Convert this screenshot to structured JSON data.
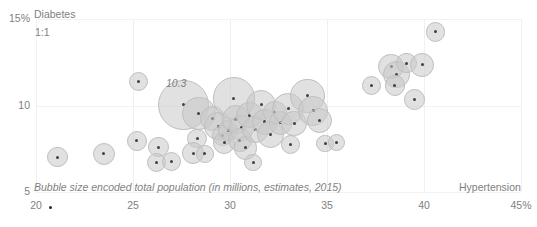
{
  "chart_data": {
    "type": "scatter",
    "title": "",
    "xlabel": "Hypertension",
    "ylabel": "Diabetes",
    "xlim": [
      20,
      45
    ],
    "ylim": [
      5,
      15
    ],
    "grid": "vertical-light",
    "legend": "none",
    "xticks": [
      "20",
      "25",
      "30",
      "35",
      "40",
      "45%"
    ],
    "xtick_values": [
      20,
      25,
      30,
      35,
      40,
      45
    ],
    "yticks": [
      "15%",
      "10",
      "5"
    ],
    "ytick_values": [
      15,
      10,
      5
    ],
    "annotations": [
      {
        "text": "1:1",
        "x": 20.6,
        "y": 14.2
      },
      {
        "text": "10.3",
        "x": 26.3,
        "y": 11.1
      }
    ],
    "footnote": "Bubble size encoded total population (in millions, estimates, 2015)",
    "size_encoding": "total population (in millions, estimates, 2015)",
    "bubble_fill": "#c8c8c8",
    "bubble_stroke": "#bfbfbf",
    "marker_color": "#404040",
    "axis_text_color": "#808080",
    "points": [
      {
        "x": 21.1,
        "y": 7.02,
        "size": 5.0
      },
      {
        "x": 23.5,
        "y": 7.2,
        "size": 5.5
      },
      {
        "x": 25.3,
        "y": 11.4,
        "size": 4.5
      },
      {
        "x": 25.2,
        "y": 7.95,
        "size": 5.0
      },
      {
        "x": 26.3,
        "y": 7.6,
        "size": 5.0
      },
      {
        "x": 26.2,
        "y": 6.7,
        "size": 4.5
      },
      {
        "x": 27.0,
        "y": 6.75,
        "size": 4.5
      },
      {
        "x": 27.6,
        "y": 10.05,
        "size": 14.5
      },
      {
        "x": 28.4,
        "y": 9.55,
        "size": 9.0
      },
      {
        "x": 28.3,
        "y": 8.1,
        "size": 4.5
      },
      {
        "x": 28.1,
        "y": 7.25,
        "size": 5.5
      },
      {
        "x": 28.7,
        "y": 7.2,
        "size": 4.0
      },
      {
        "x": 29.1,
        "y": 9.25,
        "size": 6.5
      },
      {
        "x": 29.4,
        "y": 8.8,
        "size": 7.5
      },
      {
        "x": 29.6,
        "y": 8.25,
        "size": 5.0
      },
      {
        "x": 29.7,
        "y": 7.85,
        "size": 5.5
      },
      {
        "x": 29.9,
        "y": 8.55,
        "size": 5.0
      },
      {
        "x": 30.2,
        "y": 10.4,
        "size": 12.0
      },
      {
        "x": 30.3,
        "y": 9.2,
        "size": 7.5
      },
      {
        "x": 30.6,
        "y": 8.7,
        "size": 6.5
      },
      {
        "x": 30.5,
        "y": 8.0,
        "size": 6.0
      },
      {
        "x": 30.8,
        "y": 7.55,
        "size": 6.0
      },
      {
        "x": 31.0,
        "y": 9.45,
        "size": 7.0
      },
      {
        "x": 31.3,
        "y": 8.6,
        "size": 7.0
      },
      {
        "x": 31.2,
        "y": 6.7,
        "size": 4.0
      },
      {
        "x": 31.6,
        "y": 10.05,
        "size": 8.0
      },
      {
        "x": 31.8,
        "y": 9.05,
        "size": 6.5
      },
      {
        "x": 32.1,
        "y": 8.3,
        "size": 7.0
      },
      {
        "x": 32.3,
        "y": 9.6,
        "size": 6.0
      },
      {
        "x": 32.6,
        "y": 9.0,
        "size": 6.0
      },
      {
        "x": 33.0,
        "y": 9.8,
        "size": 8.5
      },
      {
        "x": 33.3,
        "y": 8.95,
        "size": 6.5
      },
      {
        "x": 33.1,
        "y": 7.75,
        "size": 4.5
      },
      {
        "x": 34.0,
        "y": 10.55,
        "size": 9.5
      },
      {
        "x": 34.3,
        "y": 9.7,
        "size": 8.0
      },
      {
        "x": 34.6,
        "y": 9.15,
        "size": 6.5
      },
      {
        "x": 34.9,
        "y": 7.8,
        "size": 4.0
      },
      {
        "x": 35.5,
        "y": 7.85,
        "size": 4.0
      },
      {
        "x": 37.3,
        "y": 11.15,
        "size": 4.5
      },
      {
        "x": 38.3,
        "y": 12.25,
        "size": 6.5
      },
      {
        "x": 38.6,
        "y": 11.8,
        "size": 7.0
      },
      {
        "x": 38.5,
        "y": 11.15,
        "size": 5.0
      },
      {
        "x": 39.1,
        "y": 12.45,
        "size": 5.0
      },
      {
        "x": 39.5,
        "y": 10.35,
        "size": 5.0
      },
      {
        "x": 39.9,
        "y": 12.35,
        "size": 6.0
      },
      {
        "x": 40.6,
        "y": 14.25,
        "size": 4.5
      }
    ]
  }
}
